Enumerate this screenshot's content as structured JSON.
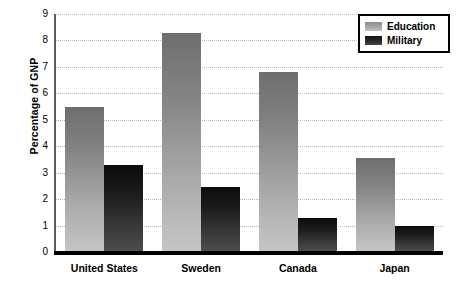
{
  "chart_data": {
    "type": "bar",
    "title": "",
    "xlabel": "",
    "ylabel": "Percentage of GNP",
    "ylim": [
      0,
      9
    ],
    "yticks": [
      0,
      1,
      2,
      3,
      4,
      5,
      6,
      7,
      8,
      9
    ],
    "ytick_labels": [
      "0",
      "1",
      "2",
      "3",
      "4",
      "5",
      "6",
      "7",
      "8",
      "9"
    ],
    "grid": true,
    "grid_axis": "y",
    "legend_position": "top-right",
    "categories": [
      "United States",
      "Sweden",
      "Canada",
      "Japan"
    ],
    "series": [
      {
        "name": "Education",
        "color": "#a8a8a8",
        "values": [
          5.5,
          8.3,
          6.8,
          3.55
        ]
      },
      {
        "name": "Military",
        "color": "#2a2a2a",
        "values": [
          3.3,
          2.45,
          1.27,
          1.0
        ]
      }
    ]
  },
  "legend": {
    "items": [
      {
        "label": "Education",
        "swatch": "education-swatch"
      },
      {
        "label": "Military",
        "swatch": "military-swatch"
      }
    ]
  }
}
